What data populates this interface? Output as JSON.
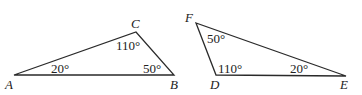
{
  "triangles": [
    {
      "name": "ABC",
      "vertices": {
        "A": {
          "label": "A",
          "x": 14,
          "y": 75
        },
        "B": {
          "label": "B",
          "x": 174,
          "y": 75
        },
        "C": {
          "label": "C",
          "x": 136,
          "y": 32
        }
      },
      "angles": {
        "A": "20°",
        "B": "50°",
        "C": "110°"
      }
    },
    {
      "name": "DEF",
      "vertices": {
        "D": {
          "label": "D",
          "x": 216,
          "y": 75
        },
        "E": {
          "label": "E",
          "x": 346,
          "y": 76
        },
        "F": {
          "label": "F",
          "x": 196,
          "y": 23
        }
      },
      "angles": {
        "D": "110°",
        "E": "20°",
        "F": "50°"
      }
    }
  ],
  "colors": {
    "stroke": "#2a2a2a",
    "text": "#222222",
    "background": "#ffffff"
  }
}
